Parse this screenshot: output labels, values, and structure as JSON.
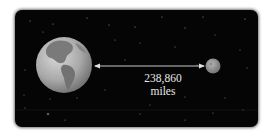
{
  "diagram": {
    "earth": {
      "icon": "earth-icon"
    },
    "moon": {
      "icon": "moon-icon"
    },
    "distance": {
      "value": "238,860",
      "unit": "miles"
    },
    "colors": {
      "background": "#050505",
      "text": "#e8e8e8",
      "arrow": "#e0e0e0"
    }
  }
}
